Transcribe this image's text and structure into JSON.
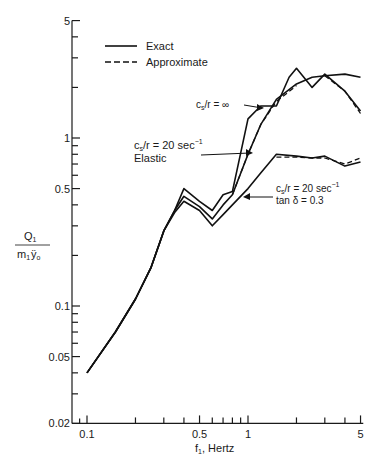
{
  "chart_data": {
    "type": "line",
    "title": "",
    "xlabel": "f1, Hertz",
    "ylabel": "Q1 / (m1 ÿo)",
    "xscale": "log",
    "yscale": "log",
    "xlim": [
      0.085,
      5.2
    ],
    "ylim": [
      0.02,
      5
    ],
    "x_ticks": [
      0.1,
      0.5,
      1,
      5
    ],
    "x_tick_labels": [
      "0.1",
      "0.5",
      "1",
      "5"
    ],
    "y_ticks": [
      0.02,
      0.05,
      0.1,
      0.5,
      1,
      5
    ],
    "y_tick_labels": [
      "0.02",
      "0.05",
      "0.1",
      "0.5",
      "1",
      "5"
    ],
    "grid": false,
    "legend": {
      "position": "upper-left",
      "entries": [
        {
          "label": "Exact",
          "style": "solid"
        },
        {
          "label": "Approximate",
          "style": "dashed"
        }
      ]
    },
    "series": [
      {
        "name": "cs/r = ∞ (Exact)",
        "style": "solid",
        "x": [
          0.1,
          0.15,
          0.2,
          0.25,
          0.3,
          0.35,
          0.4,
          0.5,
          0.6,
          0.7,
          0.8,
          1.0,
          1.2,
          1.5,
          1.8,
          2.0,
          2.5,
          3.0,
          4.0,
          5.0
        ],
        "y": [
          0.04,
          0.07,
          0.11,
          0.17,
          0.28,
          0.37,
          0.5,
          0.42,
          0.37,
          0.46,
          0.48,
          1.3,
          1.55,
          1.55,
          2.3,
          2.6,
          2.0,
          2.4,
          1.9,
          1.45
        ]
      },
      {
        "name": "cs/r = ∞ (Approximate)",
        "style": "dashed",
        "x": [
          3.0,
          4.0,
          5.0
        ],
        "y": [
          2.35,
          1.9,
          1.4
        ]
      },
      {
        "name": "cs/r = 20 sec^-1 Elastic (Exact)",
        "style": "solid",
        "x": [
          0.1,
          0.15,
          0.2,
          0.25,
          0.3,
          0.35,
          0.4,
          0.5,
          0.6,
          0.7,
          0.8,
          1.0,
          1.2,
          1.5,
          2.0,
          2.5,
          3.0,
          4.0,
          5.0
        ],
        "y": [
          0.04,
          0.07,
          0.11,
          0.17,
          0.28,
          0.37,
          0.45,
          0.39,
          0.33,
          0.4,
          0.46,
          0.8,
          1.2,
          1.7,
          2.1,
          2.3,
          2.35,
          2.4,
          2.3
        ]
      },
      {
        "name": "cs/r = 20 sec^-1 Elastic (Approximate)",
        "style": "dashed",
        "x": [
          0.8,
          1.0,
          1.2,
          1.5,
          2.0
        ],
        "y": [
          0.46,
          0.8,
          1.2,
          1.65,
          2.05
        ]
      },
      {
        "name": "cs/r = 20 sec^-1 tan δ = 0.3 (Exact)",
        "style": "solid",
        "x": [
          0.1,
          0.15,
          0.2,
          0.25,
          0.3,
          0.35,
          0.4,
          0.5,
          0.6,
          0.7,
          0.8,
          1.0,
          1.2,
          1.5,
          2.0,
          2.5,
          3.0,
          4.0,
          5.0
        ],
        "y": [
          0.04,
          0.07,
          0.11,
          0.17,
          0.28,
          0.36,
          0.42,
          0.37,
          0.3,
          0.35,
          0.4,
          0.5,
          0.62,
          0.8,
          0.78,
          0.76,
          0.78,
          0.68,
          0.72
        ]
      },
      {
        "name": "cs/r = 20 sec^-1 tan δ = 0.3 (Approximate)",
        "style": "dashed",
        "x": [
          1.5,
          2.0,
          2.5,
          3.0,
          4.0,
          5.0
        ],
        "y": [
          0.77,
          0.77,
          0.76,
          0.76,
          0.7,
          0.76
        ]
      }
    ],
    "annotations": [
      {
        "text": "cs/r = ∞",
        "points_to": [
          1.25,
          1.55
        ]
      },
      {
        "text": "cs/r = 20 sec⁻¹",
        "text2": "Elastic",
        "points_to": [
          1.1,
          0.8
        ]
      },
      {
        "text": "cs/r = 20 sec⁻¹",
        "text2": "tan δ = 0.3",
        "points_to": [
          1.0,
          0.52
        ]
      }
    ]
  },
  "labels": {
    "legend_exact": "Exact",
    "legend_approx": "Approximate",
    "ann_inf_pre": "c",
    "ann_inf_sub": "s",
    "ann_inf_post": "/r = ∞",
    "ann_el_pre": "c",
    "ann_el_sub": "s",
    "ann_el_post": "/r = 20 sec",
    "ann_el_sup": "−1",
    "ann_el_line2": "Elastic",
    "ann_d_pre": "c",
    "ann_d_sub": "s",
    "ann_d_post": "/r = 20 sec",
    "ann_d_sup": "−1",
    "ann_d_line2": "tan δ = 0.3",
    "ylabel_num": "Q",
    "ylabel_num_sub": "1",
    "ylabel_den": "m",
    "ylabel_den_sub": "1",
    "ylabel_den_post": "ÿ",
    "ylabel_den_sub2": "o",
    "xlabel_pre": "f",
    "xlabel_sub": "1",
    "xlabel_post": ", Hertz"
  }
}
